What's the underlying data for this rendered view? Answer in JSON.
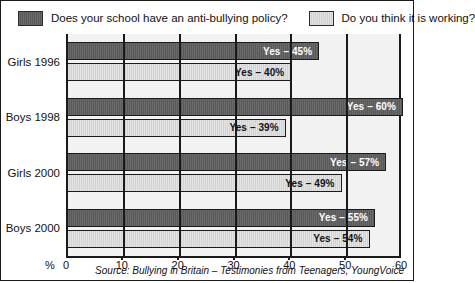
{
  "legend": {
    "items": [
      {
        "label": "Does your school have an anti-bullying policy?",
        "swatch": "dark-swatch-icon",
        "color": "#595959"
      },
      {
        "label": "Do you think it is working?",
        "swatch": "light-swatch-icon",
        "color": "#d2d2d2"
      }
    ]
  },
  "source": "Source: Bullying in Britain – Testimonies from Teenagers, YoungVoice",
  "axis": {
    "unit_label": "%",
    "tick_labels": [
      "0",
      "10",
      "20",
      "30",
      "40",
      "50",
      "60"
    ]
  },
  "chart_data": {
    "type": "bar",
    "orientation": "horizontal",
    "title": "",
    "subtitle": "",
    "xlabel": "%",
    "ylabel": "",
    "xlim": [
      0,
      60
    ],
    "xticks": [
      0,
      10,
      20,
      30,
      40,
      50,
      60
    ],
    "grid": true,
    "legend_position": "top",
    "categories": [
      "Girls 1996",
      "Boys 1998",
      "Girls 2000",
      "Boys 2000"
    ],
    "series": [
      {
        "name": "Does your school have an anti-bullying policy?",
        "color": "#595959",
        "values": [
          45,
          60,
          57,
          55
        ],
        "data_labels": [
          "Yes – 45%",
          "Yes – 60%",
          "Yes – 57%",
          "Yes – 55%"
        ]
      },
      {
        "name": "Do you think it is working?",
        "color": "#d2d2d2",
        "values": [
          40,
          39,
          49,
          54
        ],
        "data_labels": [
          "Yes – 40%",
          "Yes – 39%",
          "Yes – 49%",
          "Yes – 54%"
        ]
      }
    ],
    "source": "Source: Bullying in Britain – Testimonies from Teenagers, YoungVoice"
  }
}
